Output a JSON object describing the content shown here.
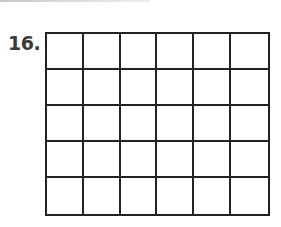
{
  "problem": {
    "number_label": "16.",
    "grid": {
      "rows": 5,
      "columns": 6,
      "line_color": "#222222"
    }
  }
}
